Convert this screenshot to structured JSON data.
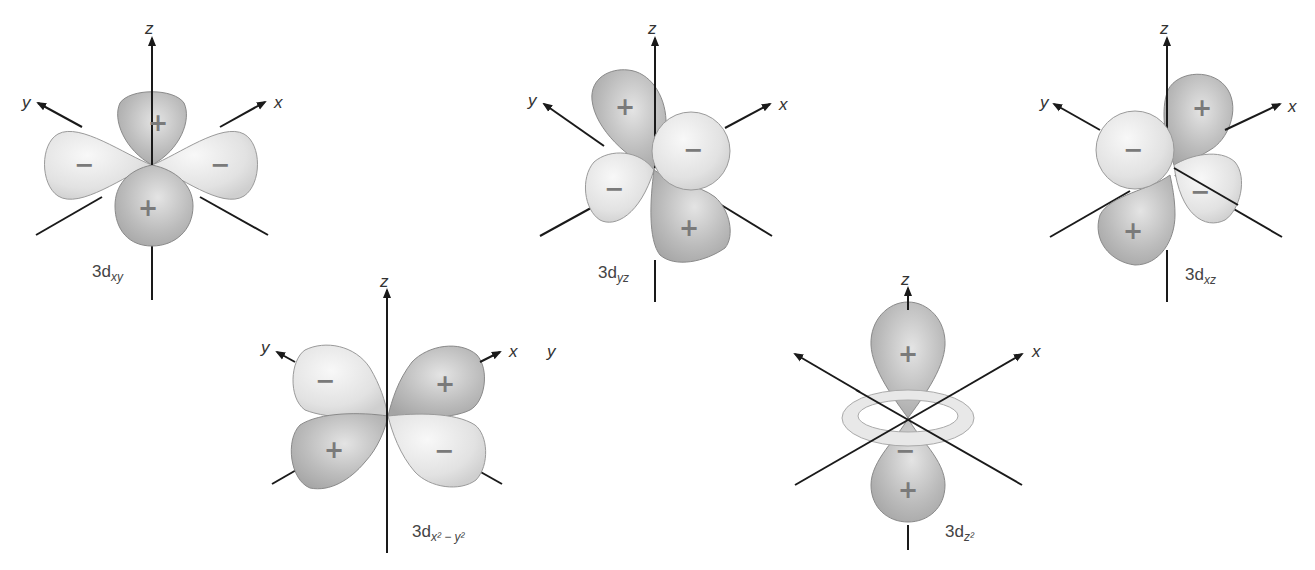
{
  "figure": {
    "colors": {
      "light_lobe": "#e6e6e6",
      "dark_lobe": "#b8b8b8",
      "axis": "#1a1a1a",
      "sign": "#7a7a7a"
    },
    "orbitals": [
      {
        "id": "dxy",
        "caption_main": "3d",
        "caption_sub": "xy",
        "axes": {
          "z": "z",
          "x": "x",
          "y": "y"
        },
        "lobes": [
          {
            "sign": "+"
          },
          {
            "sign": "−"
          },
          {
            "sign": "−"
          },
          {
            "sign": "+"
          }
        ]
      },
      {
        "id": "dyz",
        "caption_main": "3d",
        "caption_sub": "yz",
        "axes": {
          "z": "z",
          "x": "x",
          "y": "y"
        },
        "lobes": [
          {
            "sign": "+"
          },
          {
            "sign": "−"
          },
          {
            "sign": "−"
          },
          {
            "sign": "+"
          }
        ]
      },
      {
        "id": "dxz",
        "caption_main": "3d",
        "caption_sub": "xz",
        "axes": {
          "z": "z",
          "x": "x",
          "y": "y"
        },
        "lobes": [
          {
            "sign": "+"
          },
          {
            "sign": "−"
          },
          {
            "sign": "−"
          },
          {
            "sign": "+"
          }
        ]
      },
      {
        "id": "dx2y2",
        "caption_main": "3d",
        "caption_sub": "x² − y²",
        "axes": {
          "z": "z",
          "x": "x",
          "y": "y"
        },
        "lobes": [
          {
            "sign": "−"
          },
          {
            "sign": "+"
          },
          {
            "sign": "+"
          },
          {
            "sign": "−"
          }
        ]
      },
      {
        "id": "dz2",
        "caption_main": "3d",
        "caption_sub": "z²",
        "axes": {
          "z": "z",
          "x": "x",
          "y": "y"
        },
        "lobes": [
          {
            "sign": "+"
          },
          {
            "sign": "−"
          },
          {
            "sign": "+"
          }
        ]
      }
    ]
  }
}
